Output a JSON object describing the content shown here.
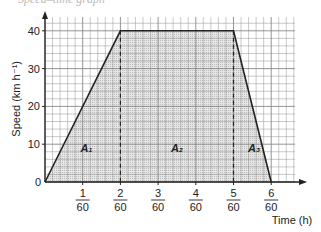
{
  "page": {
    "title_fragment": "Speed–time graph",
    "footer_fragment": "Here ... The"
  },
  "chart_data": {
    "type": "line",
    "title": "Speed–time graph",
    "xlabel": "Time (h)",
    "ylabel": "Speed (km h⁻¹)",
    "x": [
      0,
      2,
      5,
      6
    ],
    "x_units_note": "values in sixtieths of an hour (x/60 h)",
    "values": [
      0,
      40,
      40,
      0
    ],
    "x_ticks": [
      {
        "num": "1",
        "den": "60"
      },
      {
        "num": "2",
        "den": "60"
      },
      {
        "num": "3",
        "den": "60"
      },
      {
        "num": "4",
        "den": "60"
      },
      {
        "num": "5",
        "den": "60"
      },
      {
        "num": "6",
        "den": "60"
      }
    ],
    "y_ticks": [
      "0",
      "10",
      "20",
      "30",
      "40"
    ],
    "xlim": [
      0,
      6.6
    ],
    "ylim": [
      0,
      44
    ],
    "grid": true,
    "shaded_regions": [
      {
        "label": "A₁",
        "x_range": [
          0,
          2
        ],
        "shape": "triangle"
      },
      {
        "label": "A₂",
        "x_range": [
          2,
          5
        ],
        "shape": "rectangle"
      },
      {
        "label": "A₃",
        "x_range": [
          5,
          6
        ],
        "shape": "triangle"
      }
    ],
    "dashed_verticals": [
      2,
      5
    ],
    "colors": {
      "line": "#222222",
      "grid": "#888888",
      "shade": "#d8d8d8"
    }
  }
}
